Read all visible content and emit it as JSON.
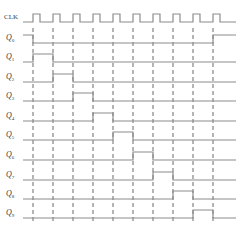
{
  "colors": {
    "background": "#ffffff",
    "waveform": "#8c8c8c",
    "dashed_guides": "#5a5a5a",
    "labels": "#3a3a3a"
  },
  "timing": {
    "x_start": 23,
    "x_end": 236,
    "clock_edges": [
      33,
      53,
      73,
      93,
      113,
      133,
      153,
      173,
      193,
      213
    ],
    "clock_high_width": 7,
    "high_offset": 8,
    "guide_top": 28,
    "guide_bottom": 222
  },
  "signals": [
    {
      "name": "CLK",
      "label_main": "CLK",
      "label_sub": "",
      "baseline": 22,
      "type": "clock"
    },
    {
      "name": "Q0",
      "label_main": "Q",
      "label_sub": "0",
      "baseline": 43,
      "type": "state",
      "initial": 1,
      "transitions": [
        [
          33,
          0
        ],
        [
          213,
          1
        ]
      ]
    },
    {
      "name": "Q1",
      "label_main": "Q",
      "label_sub": "1",
      "baseline": 62,
      "type": "state",
      "initial": 0,
      "transitions": [
        [
          33,
          1
        ],
        [
          53,
          0
        ]
      ]
    },
    {
      "name": "Q2",
      "label_main": "Q",
      "label_sub": "2",
      "baseline": 82,
      "type": "state",
      "initial": 0,
      "transitions": [
        [
          53,
          1
        ],
        [
          73,
          0
        ]
      ]
    },
    {
      "name": "Q3",
      "label_main": "Q",
      "label_sub": "3",
      "baseline": 101,
      "type": "state",
      "initial": 0,
      "transitions": [
        [
          73,
          1
        ],
        [
          93,
          0
        ]
      ]
    },
    {
      "name": "Q4",
      "label_main": "Q",
      "label_sub": "4",
      "baseline": 121,
      "type": "state",
      "initial": 0,
      "transitions": [
        [
          93,
          1
        ],
        [
          113,
          0
        ]
      ]
    },
    {
      "name": "Q5",
      "label_main": "Q",
      "label_sub": "5",
      "baseline": 140,
      "type": "state",
      "initial": 0,
      "transitions": [
        [
          113,
          1
        ],
        [
          133,
          0
        ]
      ]
    },
    {
      "name": "Q6",
      "label_main": "Q",
      "label_sub": "6",
      "baseline": 160,
      "type": "state",
      "initial": 0,
      "transitions": [
        [
          133,
          1
        ],
        [
          153,
          0
        ]
      ]
    },
    {
      "name": "Q7",
      "label_main": "Q",
      "label_sub": "7",
      "baseline": 180,
      "type": "state",
      "initial": 0,
      "transitions": [
        [
          153,
          1
        ],
        [
          173,
          0
        ]
      ]
    },
    {
      "name": "Q8",
      "label_main": "Q",
      "label_sub": "8",
      "baseline": 199,
      "type": "state",
      "initial": 0,
      "transitions": [
        [
          173,
          1
        ],
        [
          193,
          0
        ]
      ]
    },
    {
      "name": "Q9",
      "label_main": "Q",
      "label_sub": "9",
      "baseline": 218,
      "type": "state",
      "initial": 0,
      "transitions": [
        [
          193,
          1
        ],
        [
          213,
          0
        ]
      ]
    }
  ]
}
